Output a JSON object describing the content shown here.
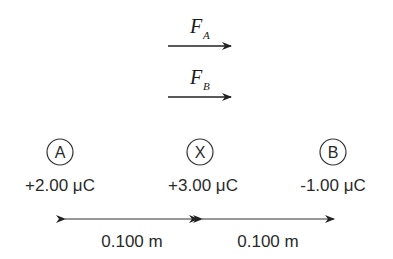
{
  "forces": [
    {
      "symbol": "F",
      "subscript": "A"
    },
    {
      "symbol": "F",
      "subscript": "B"
    }
  ],
  "charges": [
    {
      "label": "A",
      "value": "+2.00 μC"
    },
    {
      "label": "X",
      "value": "+3.00 μC"
    },
    {
      "label": "B",
      "value": "-1.00 μC"
    }
  ],
  "distances": [
    {
      "label": "0.100 m"
    },
    {
      "label": "0.100 m"
    }
  ],
  "colors": {
    "ink": "#2a2a2a",
    "background": "#ffffff"
  }
}
